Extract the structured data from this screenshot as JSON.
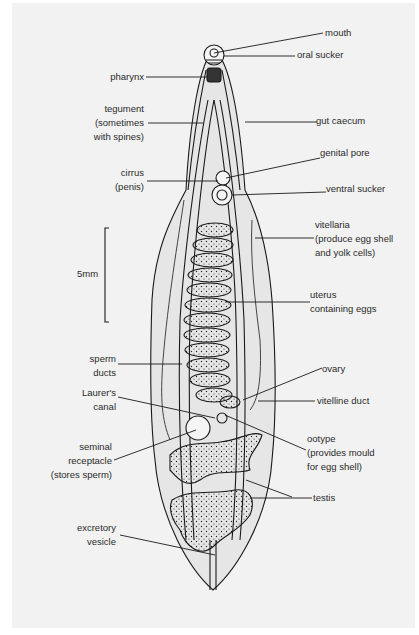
{
  "figure": {
    "scale_bar": {
      "label": "5mm"
    },
    "labels_right": {
      "mouth": "mouth",
      "oral_sucker": "oral sucker",
      "gut_caecum": "gut caecum",
      "genital_pore": "genital pore",
      "ventral_sucker": "ventral sucker",
      "vitellaria": [
        "vitellaria",
        "(produce egg shell",
        "and yolk cells)"
      ],
      "uterus": [
        "uterus",
        "containing eggs"
      ],
      "ovary": "ovary",
      "vitelline_duct": "vitelline duct",
      "ootype": [
        "ootype",
        "(provides mould",
        "for egg shell)"
      ],
      "testis": "testis"
    },
    "labels_left": {
      "pharynx": "pharynx",
      "tegument": [
        "tegument",
        "(sometimes",
        "with spines)"
      ],
      "cirrus": [
        "cirrus",
        "(penis)"
      ],
      "sperm_ducts": [
        "sperm",
        "ducts"
      ],
      "laurers_canal": [
        "Laurer's",
        "canal"
      ],
      "seminal_receptacle": [
        "seminal",
        "receptacle",
        "(stores sperm)"
      ],
      "excretory_vesicle": [
        "excretory",
        "vesicle"
      ]
    },
    "colors": {
      "panel": "#f2f2f2",
      "ink": "#1a1a1a",
      "body_fill": "#e6e6e6"
    }
  }
}
